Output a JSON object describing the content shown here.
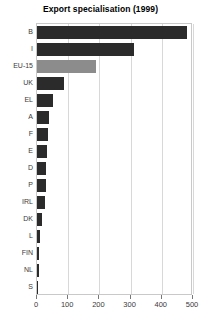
{
  "chart_data": {
    "type": "bar",
    "orientation": "horizontal",
    "title": "Export specialisation (1999)",
    "xlabel": "",
    "ylabel": "",
    "categories": [
      "B",
      "I",
      "EU-15",
      "UK",
      "EL",
      "A",
      "F",
      "E",
      "D",
      "P",
      "IRL",
      "DK",
      "L",
      "FIN",
      "NL",
      "S"
    ],
    "values": [
      480,
      310,
      190,
      85,
      51,
      38,
      35,
      32,
      30,
      29,
      26,
      16,
      10,
      8,
      6,
      3
    ],
    "xlim": [
      0,
      500
    ],
    "xticks": [
      0,
      100,
      200,
      300,
      400,
      500
    ],
    "xticklabels": [
      "0",
      "100",
      "200",
      "300",
      "400",
      "500"
    ],
    "grid": true,
    "legend": false,
    "highlight_category": "EU-15",
    "colors": {
      "bar": "#2b2b2b",
      "highlight_bar": "#8c8c8c",
      "gridline": "#d8d8d8",
      "frame": "#c9c9c9",
      "text": "#3a3a3a",
      "title": "#000000",
      "background": "#ffffff"
    }
  }
}
